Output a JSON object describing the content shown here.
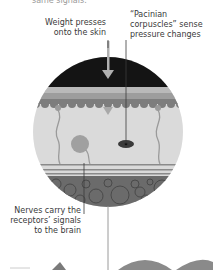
{
  "labels": {
    "top_cut": "same signals.",
    "weight": "Weight presses onto the skin",
    "pacinian": "“Pacinian corpuscles” sense pressure changes",
    "nerves": "Nerves carry the receptors’ signals to the brain"
  },
  "diagram": {
    "layers": [
      "pressure-surface",
      "epidermis",
      "dermis",
      "nerve-fibres",
      "fat-tissue"
    ],
    "colors": {
      "surface": "#141414",
      "epidermis_top": "#b8b8b8",
      "epidermis_mid": "#9c9c9c",
      "epidermis_bottom": "#7c7c7c",
      "dermis": "#d9d9d9",
      "fat": "#6a6a6a",
      "receptor": "#3a3a3a",
      "nerve": "#9a9a9a",
      "leader_line": "#3a3a3a"
    }
  }
}
